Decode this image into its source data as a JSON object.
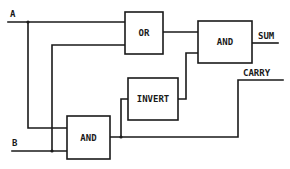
{
  "diagram": {
    "inputs": [
      {
        "id": "A",
        "label": "A"
      },
      {
        "id": "B",
        "label": "B"
      }
    ],
    "outputs": [
      {
        "id": "SUM",
        "label": "SUM"
      },
      {
        "id": "CARRY",
        "label": "CARRY"
      }
    ],
    "gates": [
      {
        "id": "or",
        "label": "OR"
      },
      {
        "id": "and_sum",
        "label": "AND"
      },
      {
        "id": "invert",
        "label": "INVERT"
      },
      {
        "id": "and_carry",
        "label": "AND"
      }
    ],
    "colors": {
      "stroke": "#1a1a1a",
      "background": "#ffffff"
    }
  }
}
